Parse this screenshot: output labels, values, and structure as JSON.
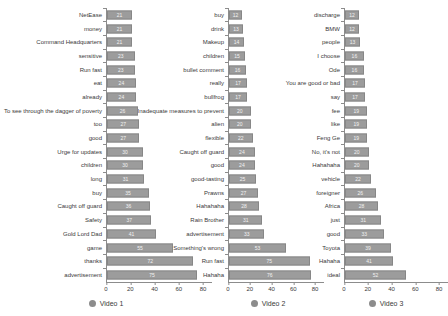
{
  "chart_data": [
    {
      "type": "bar",
      "orientation": "horizontal",
      "legend": "Video 1",
      "xlim": [
        0,
        80
      ],
      "xticks": [
        0,
        20,
        40,
        60,
        80
      ],
      "grid": false,
      "legend_position": "bottom",
      "categories": [
        "NetEase",
        "money",
        "Command Headquarters",
        "sensitive",
        "Run fast",
        "eat",
        "already",
        "To see through the dagger of poverty",
        "too",
        "good",
        "Urge for updates",
        "children",
        "long",
        "buy",
        "Caught off guard",
        "Safety",
        "Gold Lord Dad",
        "game",
        "thanks",
        "advertisement"
      ],
      "values": [
        21,
        21,
        21,
        23,
        23,
        24,
        24,
        26,
        27,
        27,
        30,
        30,
        31,
        35,
        36,
        37,
        41,
        55,
        72,
        75
      ]
    },
    {
      "type": "bar",
      "orientation": "horizontal",
      "legend": "Video 2",
      "xlim": [
        0,
        80
      ],
      "xticks": [
        0,
        20,
        40,
        60,
        80
      ],
      "grid": false,
      "legend_position": "bottom",
      "categories": [
        "buy",
        "drink",
        "Makeup",
        "children",
        "bullet comment",
        "really",
        "bullfrog",
        "Inadequate measures to prevent",
        "alien",
        "flexible",
        "Caught off guard",
        "good",
        "good-tasting",
        "Prawns",
        "Hahahaha",
        "Rain Brother",
        "advertisement",
        "Something's wrong",
        "Run fast",
        "Hahaha"
      ],
      "values": [
        12,
        13,
        14,
        15,
        16,
        17,
        17,
        20,
        20,
        22,
        24,
        24,
        25,
        27,
        28,
        31,
        33,
        53,
        75,
        76
      ]
    },
    {
      "type": "bar",
      "orientation": "horizontal",
      "legend": "Video 3",
      "xlim": [
        0,
        80
      ],
      "xticks": [
        0,
        20,
        40,
        60,
        80
      ],
      "grid": false,
      "legend_position": "bottom",
      "categories": [
        "discharge",
        "BMW",
        "people",
        "I choose",
        "Ode",
        "You are good or bad",
        "say",
        "fee",
        "like",
        "Feng Ge",
        "No, it's not",
        "Hahahaha",
        "vehicle",
        "foreigner",
        "Africa",
        "just",
        "good",
        "Toyota",
        "Hahaha",
        "ideal"
      ],
      "values": [
        12,
        12,
        13,
        16,
        16,
        17,
        17,
        19,
        19,
        19,
        20,
        20,
        22,
        26,
        28,
        31,
        33,
        39,
        41,
        52
      ]
    }
  ],
  "colors": {
    "bar": "#9c9c9c",
    "bar_value_text": "#f2f2f2",
    "axis": "#8c8c8c",
    "label_text": "#3a3a3a",
    "legend_dot": "#8c8c8c"
  }
}
